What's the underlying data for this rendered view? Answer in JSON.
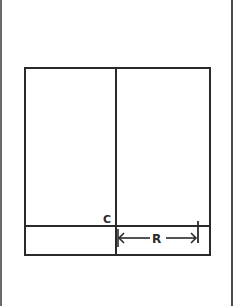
{
  "diagram": {
    "type": "geometric-layout",
    "stroke_color": "#2a2a2a",
    "background": "#ffffff",
    "labels": {
      "corner": "C",
      "dimension": "R"
    },
    "outer_rectangle": {
      "x1": 25,
      "y1": 68,
      "x2": 210,
      "y2": 255
    },
    "vertical_divider_x": 116,
    "horizontal_divider_y": 226,
    "dimension_arrow": {
      "from_x": 118,
      "to_x": 197,
      "y": 238,
      "end_tick_x": 198,
      "end_tick_y1": 221,
      "end_tick_y2": 243
    }
  }
}
